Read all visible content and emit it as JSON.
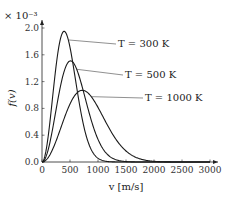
{
  "chart_data": {
    "type": "line",
    "title": "",
    "scale_label": "× 10⁻³",
    "xlabel": "v [m/s]",
    "ylabel": "f(v)",
    "xlim": [
      0,
      3000
    ],
    "ylim": [
      0,
      2.0
    ],
    "xticks": [
      0,
      500,
      1000,
      1500,
      2000,
      2500,
      3000
    ],
    "xtick_labels": [
      "0",
      "500",
      "1000",
      "1500",
      "2000",
      "2500",
      "3000"
    ],
    "yticks": [
      0.0,
      0.4,
      0.8,
      1.2,
      1.6,
      2.0
    ],
    "ytick_labels": [
      "0.0",
      "0.4",
      "0.8",
      "1.2",
      "1.6",
      "2.0"
    ],
    "grid": false,
    "legend": "inline annotations",
    "series": [
      {
        "name": "T = 300 K",
        "T": 300,
        "peak_v": 395,
        "peak_f": 1.95
      },
      {
        "name": "T = 500 K",
        "T": 500,
        "peak_v": 510,
        "peak_f": 1.51
      },
      {
        "name": "T = 1000 K",
        "T": 1000,
        "peak_v": 720,
        "peak_f": 1.07
      }
    ],
    "annotations": [
      "T = 300 K",
      "T = 500 K",
      "T = 1000 K"
    ]
  }
}
